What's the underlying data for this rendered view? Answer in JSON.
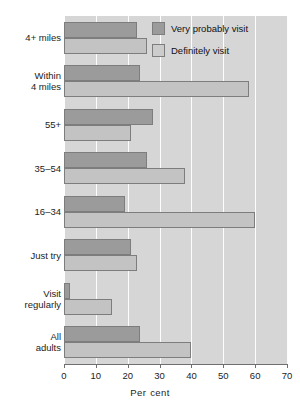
{
  "chart_data": {
    "type": "bar",
    "orientation": "horizontal",
    "title": "",
    "xlabel": "Per cent",
    "ylabel": "",
    "xlim": [
      0,
      70
    ],
    "xticks": [
      0,
      10,
      20,
      30,
      40,
      50,
      60,
      70
    ],
    "xtick_labels": [
      "0",
      "10",
      "20",
      "30",
      "40",
      "50",
      "60",
      "70"
    ],
    "grid": "vertical-white",
    "legend_position": "top-right",
    "categories": [
      "4+ miles",
      "Within 4 miles",
      "55+",
      "35–54",
      "16–34",
      "Just try",
      "Visit regularly",
      "All adults"
    ],
    "category_lines": [
      [
        "4+ miles"
      ],
      [
        "Within",
        "4 miles"
      ],
      [
        "55+"
      ],
      [
        "35–54"
      ],
      [
        "16–34"
      ],
      [
        "Just try"
      ],
      [
        "Visit",
        "regularly"
      ],
      [
        "All",
        "adults"
      ]
    ],
    "series": [
      {
        "name": "Very probably visit",
        "color": "#9b9b9b",
        "values": [
          23,
          24,
          28,
          26,
          19,
          21,
          2,
          24
        ]
      },
      {
        "name": "Definitely visit",
        "color": "#c3c3c3",
        "values": [
          26,
          58,
          21,
          38,
          60,
          23,
          15,
          40
        ]
      }
    ]
  },
  "legend": {
    "items": [
      {
        "label": "Very probably visit",
        "swatch": "dark"
      },
      {
        "label": "Definitely visit",
        "swatch": "light"
      }
    ]
  },
  "axis": {
    "title_word_1": "Per",
    "title_word_2": "cent"
  },
  "colors": {
    "plot_background": "#d6d6d6",
    "gridline": "#ffffff",
    "bar_dark": "#9b9b9b",
    "bar_light": "#c3c3c3",
    "bar_border": "#7d7d7d",
    "text": "#1c1c1c"
  }
}
